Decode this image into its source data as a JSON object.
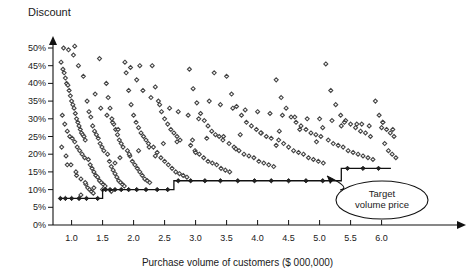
{
  "chart_data": {
    "type": "scatter",
    "title": "",
    "ylabel": "Discount",
    "xlabel": "Purchase volume of customers ($ 000,000)",
    "xlim": [
      0.7,
      6.35
    ],
    "ylim": [
      0,
      0.52
    ],
    "grid": false,
    "legend": null,
    "x_ticks": [
      "1.0",
      "1.5",
      "2.0",
      "2.5",
      "3.0",
      "3.5",
      "4.0",
      "4.5",
      "5.0",
      "5.5",
      "6.0"
    ],
    "x_tick_values": [
      1.0,
      1.5,
      2.0,
      2.5,
      3.0,
      3.5,
      4.0,
      4.5,
      5.0,
      5.5,
      6.0
    ],
    "y_ticks": [
      "0%",
      "5%",
      "10%",
      "15%",
      "20%",
      "25%",
      "30%",
      "35%",
      "40%",
      "45%",
      "50%"
    ],
    "y_tick_values": [
      0,
      5,
      10,
      15,
      20,
      25,
      30,
      35,
      40,
      45,
      50
    ],
    "marker": "diamond-open",
    "marker_color": "#444444",
    "annotations": [
      {
        "name": "target-volume-price",
        "text_line1": "Target",
        "text_line2": "volume price",
        "shape": "ellipse",
        "ellipse_center_x": 382,
        "ellipse_center_y": 200,
        "ellipse_rx": 46,
        "ellipse_ry": 19,
        "arrow_from_x": 352,
        "arrow_from_y": 188,
        "arrow_to_x": 327,
        "arrow_to_y": 176
      }
    ],
    "series": [
      {
        "name": "Target volume price (step line)",
        "type": "step",
        "color": "#111111",
        "points": [
          [
            0.8,
            7.5
          ],
          [
            1.5,
            7.5
          ],
          [
            1.5,
            10.0
          ],
          [
            2.65,
            10.0
          ],
          [
            2.65,
            12.5
          ],
          [
            5.35,
            12.5
          ],
          [
            5.35,
            16.0
          ],
          [
            6.15,
            16.0
          ]
        ]
      },
      {
        "name": "Step line data markers",
        "type": "marker-overlay",
        "marker_points": [
          [
            0.82,
            7.5
          ],
          [
            0.9,
            7.5
          ],
          [
            1.0,
            7.5
          ],
          [
            1.12,
            7.5
          ],
          [
            1.24,
            7.5
          ],
          [
            1.42,
            7.5
          ],
          [
            1.55,
            10.0
          ],
          [
            1.62,
            10.0
          ],
          [
            1.7,
            10.0
          ],
          [
            1.8,
            10.0
          ],
          [
            1.92,
            10.0
          ],
          [
            2.05,
            10.0
          ],
          [
            2.2,
            10.0
          ],
          [
            2.38,
            10.0
          ],
          [
            2.55,
            10.0
          ],
          [
            2.72,
            12.5
          ],
          [
            2.92,
            12.5
          ],
          [
            3.15,
            12.5
          ],
          [
            3.4,
            12.5
          ],
          [
            3.68,
            12.5
          ],
          [
            3.95,
            12.5
          ],
          [
            4.22,
            12.5
          ],
          [
            4.5,
            12.5
          ],
          [
            4.78,
            12.5
          ],
          [
            5.05,
            12.5
          ],
          [
            5.45,
            16.0
          ],
          [
            5.7,
            16.0
          ],
          [
            5.95,
            16.0
          ]
        ]
      },
      {
        "name": "Customer discounts",
        "type": "scatter",
        "x": [
          0.83,
          0.86,
          0.88,
          0.9,
          0.92,
          0.94,
          0.96,
          0.98,
          1.0,
          1.02,
          1.04,
          1.06,
          1.08,
          1.1,
          1.12,
          1.14,
          1.16,
          1.18,
          1.2,
          1.22,
          0.85,
          0.89,
          0.93,
          0.97,
          1.01,
          1.05,
          1.09,
          1.13,
          1.17,
          1.21,
          0.84,
          0.91,
          0.99,
          1.07,
          1.15,
          1.23,
          1.26,
          1.29,
          1.32,
          1.35,
          1.25,
          1.28,
          1.31,
          1.34,
          1.37,
          1.4,
          1.43,
          1.46,
          1.49,
          1.52,
          1.27,
          1.3,
          1.33,
          1.36,
          1.39,
          1.42,
          1.45,
          1.48,
          1.51,
          1.54,
          1.56,
          1.59,
          1.62,
          1.65,
          1.68,
          1.71,
          1.74,
          1.77,
          1.8,
          1.83,
          1.58,
          1.61,
          1.64,
          1.67,
          1.7,
          1.73,
          1.76,
          1.79,
          1.82,
          1.85,
          1.88,
          1.92,
          1.96,
          2.0,
          2.04,
          2.08,
          2.12,
          2.16,
          2.2,
          2.24,
          1.9,
          1.94,
          1.98,
          2.02,
          2.06,
          2.1,
          2.14,
          2.18,
          2.22,
          2.26,
          2.3,
          2.35,
          2.4,
          2.45,
          2.5,
          2.55,
          2.6,
          2.65,
          2.7,
          2.75,
          2.32,
          2.38,
          2.44,
          2.5,
          2.56,
          2.62,
          2.68,
          2.74,
          2.8,
          2.86,
          2.9,
          2.96,
          3.02,
          3.08,
          3.14,
          3.2,
          3.26,
          3.32,
          3.38,
          3.44,
          2.92,
          2.99,
          3.06,
          3.13,
          3.2,
          3.27,
          3.34,
          3.41,
          3.48,
          3.55,
          3.5,
          3.58,
          3.66,
          3.74,
          3.82,
          3.9,
          3.98,
          4.06,
          4.14,
          4.22,
          3.54,
          3.62,
          3.7,
          3.78,
          3.86,
          3.94,
          4.02,
          4.1,
          4.18,
          4.26,
          4.3,
          4.38,
          4.46,
          4.54,
          4.62,
          4.7,
          4.78,
          4.86,
          4.94,
          5.02,
          4.34,
          4.42,
          4.5,
          4.58,
          4.66,
          4.74,
          4.82,
          4.9,
          4.98,
          5.06,
          5.1,
          5.18,
          5.26,
          5.34,
          5.42,
          5.5,
          5.58,
          5.66,
          5.74,
          5.82,
          5.14,
          5.22,
          5.3,
          5.38,
          5.46,
          5.54,
          5.62,
          5.7,
          5.78,
          5.86,
          5.9,
          5.96,
          6.02,
          6.08,
          6.14,
          6.2,
          6.05,
          6.11,
          6.17,
          6.23,
          0.87,
          0.95,
          1.03,
          1.11,
          1.19,
          1.38,
          1.47,
          1.57,
          1.66,
          1.75,
          1.86,
          1.95,
          2.05,
          2.15,
          2.28,
          2.42,
          2.58,
          2.72,
          2.88,
          3.05,
          3.22,
          3.4,
          3.6,
          3.8,
          4.0,
          4.2,
          4.4,
          4.6,
          4.8,
          5.0,
          5.2,
          5.4,
          5.6,
          5.8,
          6.0,
          6.18,
          1.05,
          1.45,
          2.1,
          3.3,
          0.93,
          1.08,
          1.22,
          1.36,
          1.5,
          1.64,
          1.78,
          1.93,
          2.08,
          2.25,
          2.48,
          2.7,
          2.95,
          3.18,
          3.45,
          3.72,
          4.05,
          4.35,
          4.68,
          5.05,
          5.35,
          5.68,
          6.02,
          1.15,
          1.7,
          2.35,
          3.0,
          3.65,
          4.3,
          4.95
        ],
        "y": [
          46.0,
          44.0,
          43.0,
          41.5,
          40.0,
          39.5,
          38.0,
          36.5,
          35.0,
          34.0,
          33.0,
          31.5,
          30.0,
          29.0,
          28.0,
          27.0,
          26.0,
          25.5,
          25.0,
          24.0,
          31.0,
          28.5,
          26.5,
          25.0,
          24.5,
          23.5,
          22.0,
          21.0,
          20.0,
          19.0,
          22.0,
          19.5,
          17.0,
          15.0,
          13.0,
          11.5,
          10.5,
          10.0,
          9.5,
          9.0,
          35.0,
          32.0,
          30.5,
          28.0,
          26.5,
          25.5,
          24.5,
          23.0,
          22.0,
          21.0,
          18.5,
          17.0,
          16.0,
          15.0,
          14.0,
          13.5,
          12.5,
          12.0,
          11.5,
          11.0,
          40.0,
          36.0,
          33.0,
          30.0,
          28.5,
          27.0,
          25.5,
          24.0,
          23.0,
          22.0,
          20.0,
          18.0,
          16.5,
          15.5,
          14.5,
          13.5,
          12.5,
          12.0,
          11.5,
          11.0,
          43.0,
          38.0,
          34.0,
          31.0,
          29.0,
          27.5,
          26.0,
          25.0,
          24.0,
          23.0,
          21.0,
          19.5,
          18.0,
          17.0,
          16.0,
          15.0,
          14.0,
          13.0,
          12.5,
          12.0,
          45.0,
          39.0,
          35.0,
          32.0,
          30.0,
          28.5,
          27.0,
          26.0,
          25.0,
          24.0,
          22.0,
          20.5,
          19.0,
          18.0,
          17.0,
          16.0,
          15.0,
          14.5,
          14.0,
          13.5,
          44.0,
          38.5,
          34.5,
          31.5,
          29.5,
          28.0,
          26.5,
          25.5,
          25.0,
          24.0,
          22.5,
          21.0,
          20.0,
          19.0,
          18.0,
          17.5,
          17.0,
          16.0,
          15.5,
          15.0,
          42.0,
          37.0,
          33.5,
          31.0,
          29.0,
          28.0,
          27.0,
          26.0,
          25.0,
          24.5,
          23.0,
          22.0,
          21.0,
          20.0,
          19.5,
          19.0,
          18.0,
          17.5,
          17.0,
          16.5,
          41.0,
          36.0,
          33.0,
          30.5,
          29.0,
          28.0,
          27.0,
          26.0,
          25.5,
          25.0,
          24.0,
          23.0,
          22.0,
          21.0,
          20.5,
          20.0,
          19.0,
          18.5,
          18.0,
          17.5,
          45.5,
          38.0,
          34.0,
          31.0,
          29.5,
          28.5,
          27.5,
          26.5,
          26.0,
          25.0,
          24.0,
          23.0,
          22.5,
          22.0,
          21.0,
          20.5,
          20.0,
          19.5,
          19.0,
          18.5,
          35.0,
          31.0,
          29.0,
          27.0,
          26.0,
          25.0,
          23.0,
          21.0,
          20.0,
          19.0,
          50.0,
          49.5,
          48.0,
          45.0,
          42.0,
          37.0,
          33.0,
          31.0,
          29.0,
          27.0,
          46.0,
          44.5,
          41.0,
          38.0,
          36.0,
          34.0,
          33.0,
          32.0,
          31.0,
          30.0,
          35.0,
          34.0,
          33.0,
          32.5,
          32.0,
          31.5,
          31.0,
          30.5,
          30.0,
          30.0,
          29.5,
          29.0,
          28.5,
          28.0,
          27.5,
          27.0,
          50.5,
          47.0,
          45.0,
          43.0,
          17.0,
          14.0,
          12.0,
          10.5,
          10.0,
          9.5,
          19.0,
          20.0,
          21.0,
          22.0,
          23.0,
          23.5,
          24.0,
          24.5,
          25.0,
          25.5,
          26.0,
          26.5,
          27.0,
          27.5,
          28.0,
          28.5,
          29.0,
          8.5,
          17.5,
          19.5,
          20.5,
          21.5,
          22.5,
          23.5
        ]
      }
    ]
  },
  "geometry": {
    "origin_x": 53,
    "origin_y": 225,
    "px_per_unit_x": 62.0,
    "px_per_pct_y": 3.54,
    "x_axis_end": 466,
    "y_axis_top": 38
  }
}
